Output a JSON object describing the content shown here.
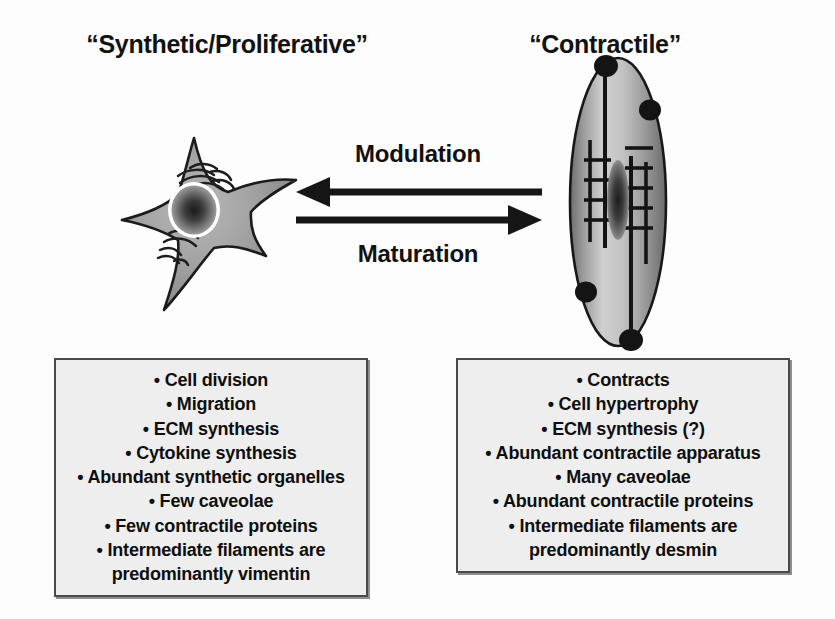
{
  "figure": {
    "kind": "smooth-muscle-cell-phenotype-diagram",
    "background_color": "#fdfdfd",
    "box_fill_color": "#eeeeee",
    "box_border_color": "#4a4a4a",
    "cell_fill_color": "#8c8c8c",
    "ink_color": "#111111"
  },
  "titles": {
    "left": "“Synthetic/Proliferative”",
    "right": "“Contractile”"
  },
  "arrows": {
    "top": {
      "label": "Modulation",
      "direction": "left",
      "icon": "arrow-left-icon"
    },
    "bottom": {
      "label": "Maturation",
      "direction": "right",
      "icon": "arrow-right-icon"
    }
  },
  "cells": {
    "synthetic": {
      "icon": "stellate-synthetic-cell-icon",
      "shape": "four-pointed-star",
      "organelles": [
        "nucleus",
        "abundant-rough-endoplasmic-reticulum",
        "golgi-apparatus"
      ]
    },
    "contractile": {
      "icon": "spindle-contractile-cell-icon",
      "shape": "elongated-spindle",
      "organelles": [
        "elongated-nucleus",
        "contractile-filament-lattice",
        "dense-bodies",
        "caveolae"
      ],
      "dense_body_count": 4
    }
  },
  "feature_boxes": {
    "synthetic": {
      "items": [
        "• Cell division",
        "• Migration",
        "• ECM synthesis",
        "• Cytokine synthesis",
        "• Abundant synthetic organelles",
        "• Few caveolae",
        "• Few contractile proteins",
        "• Intermediate filaments are predominantly vimentin"
      ]
    },
    "contractile": {
      "items": [
        "• Contracts",
        "• Cell hypertrophy",
        "• ECM synthesis (?)",
        "• Abundant contractile apparatus",
        "• Many caveolae",
        "• Abundant contractile proteins",
        "• Intermediate filaments are predominantly desmin"
      ]
    }
  }
}
